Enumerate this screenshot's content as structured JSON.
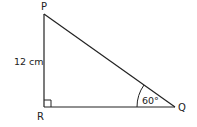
{
  "diagram": {
    "type": "right-triangle",
    "vertices": [
      {
        "label": "P",
        "x": 44,
        "y": 14
      },
      {
        "label": "R",
        "x": 44,
        "y": 107
      },
      {
        "label": "Q",
        "x": 175,
        "y": 107
      }
    ],
    "side_labels": {
      "PR": "12 cm"
    },
    "angle_labels": {
      "Q": "60°"
    },
    "right_angle_at": "R",
    "colors": {
      "stroke": "#222222",
      "background": "#ffffff"
    }
  }
}
